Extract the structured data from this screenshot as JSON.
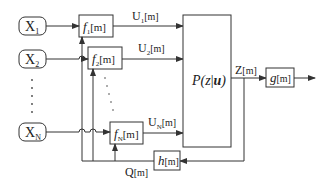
{
  "diagram": {
    "inputs": [
      {
        "name": "X",
        "sub": "1"
      },
      {
        "name": "X",
        "sub": "2"
      },
      {
        "name": "X",
        "sub": "N"
      }
    ],
    "encoders": [
      {
        "name": "f",
        "sub": "1",
        "arg": "[m]"
      },
      {
        "name": "f",
        "sub": "2",
        "arg": "[m]"
      },
      {
        "name": "f",
        "sub": "N",
        "arg": "[m]"
      }
    ],
    "signals": [
      {
        "name": "U",
        "sub": "1",
        "arg": "[m]"
      },
      {
        "name": "U",
        "sub": "2",
        "arg": "[m]"
      },
      {
        "name": "U",
        "sub": "N",
        "arg": "[m]"
      }
    ],
    "channel": {
      "p": "P(",
      "z": "z",
      "bar": "|",
      "u": "u",
      "close": ")"
    },
    "output_signal": {
      "name": "Z",
      "arg": "[m]"
    },
    "decoder": {
      "name": "g",
      "arg": "[m]"
    },
    "feedback_block": {
      "name": "h",
      "arg": "[m]"
    },
    "feedback_signal": {
      "name": "Q",
      "arg": "[m]"
    },
    "colors": {
      "line": "#333333",
      "text": "#222222",
      "background": "#ffffff"
    }
  }
}
